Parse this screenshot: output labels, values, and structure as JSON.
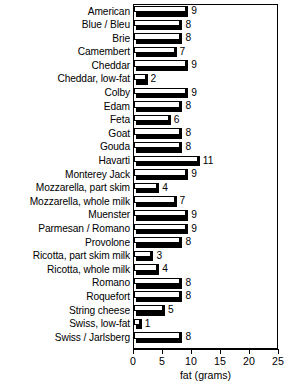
{
  "chart_data": {
    "type": "bar",
    "orientation": "horizontal",
    "title": "",
    "xlabel": "fat (grams)",
    "ylabel": "",
    "xlim": [
      0,
      25
    ],
    "xticks": [
      0,
      5,
      10,
      15,
      20,
      25
    ],
    "grid": false,
    "legend": null,
    "value_labels": true,
    "categories": [
      "American",
      "Blue / Bleu",
      "Brie",
      "Camembert",
      "Cheddar",
      "Cheddar, low-fat",
      "Colby",
      "Edam",
      "Feta",
      "Goat",
      "Gouda",
      "Havarti",
      "Monterey Jack",
      "Mozzarella, part skim",
      "Mozzarella, whole milk",
      "Muenster",
      "Parmesan / Romano",
      "Provolone",
      "Ricotta, part skim milk",
      "Ricotta, whole milk",
      "Romano",
      "Roquefort",
      "String cheese",
      "Swiss, low-fat",
      "Swiss / Jarlsberg"
    ],
    "values": [
      9,
      8,
      8,
      7,
      9,
      2,
      9,
      8,
      6,
      8,
      8,
      11,
      9,
      4,
      7,
      9,
      9,
      8,
      3,
      4,
      8,
      8,
      5,
      1,
      8
    ],
    "colors": {
      "bar_face": "#ffffff",
      "bar_outline": "#000000",
      "bar_shadow": "#000000",
      "axis": "#000000",
      "background": "#ffffff",
      "text": "#000000"
    }
  }
}
